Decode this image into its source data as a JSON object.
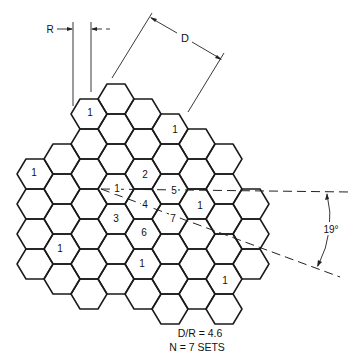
{
  "figure": {
    "dimension_labels": {
      "R": "R",
      "D": "D",
      "angle": "19°"
    },
    "caption": {
      "ratio": "D/R = 4.6",
      "sets": "N = 7 SETS"
    },
    "grid": {
      "origin_x": 116,
      "origin_y": 219,
      "col_step": 27,
      "row_step": 30,
      "hex_radius": 18,
      "columns": [
        {
          "c": -3,
          "r_min": -2,
          "r_max": 1
        },
        {
          "c": -2,
          "r_min": -2,
          "r_max": 2
        },
        {
          "c": -1,
          "r_min": -4,
          "r_max": 2
        },
        {
          "c": 0,
          "r_min": -4,
          "r_max": 2
        },
        {
          "c": 1,
          "r_min": -4,
          "r_max": 2
        },
        {
          "c": 2,
          "r_min": -3,
          "r_max": 3
        },
        {
          "c": 3,
          "r_min": -3,
          "r_max": 2
        },
        {
          "c": 4,
          "r_min": -2,
          "r_max": 3
        },
        {
          "c": 5,
          "r_min": -1,
          "r_max": 1
        }
      ]
    },
    "cell_labels": [
      {
        "text": "1",
        "x": 90,
        "y": 112
      },
      {
        "text": "1",
        "x": 175,
        "y": 129
      },
      {
        "text": "1",
        "x": 34,
        "y": 172
      },
      {
        "text": "2",
        "x": 145,
        "y": 174
      },
      {
        "text": "1",
        "x": 117,
        "y": 188
      },
      {
        "text": "5",
        "x": 174,
        "y": 190
      },
      {
        "text": "4",
        "x": 145,
        "y": 204
      },
      {
        "text": "1",
        "x": 200,
        "y": 205
      },
      {
        "text": "3",
        "x": 116,
        "y": 218
      },
      {
        "text": "7",
        "x": 173,
        "y": 218
      },
      {
        "text": "6",
        "x": 144,
        "y": 232
      },
      {
        "text": "1",
        "x": 60,
        "y": 248
      },
      {
        "text": "1",
        "x": 142,
        "y": 263
      },
      {
        "text": "1",
        "x": 225,
        "y": 280
      }
    ]
  }
}
